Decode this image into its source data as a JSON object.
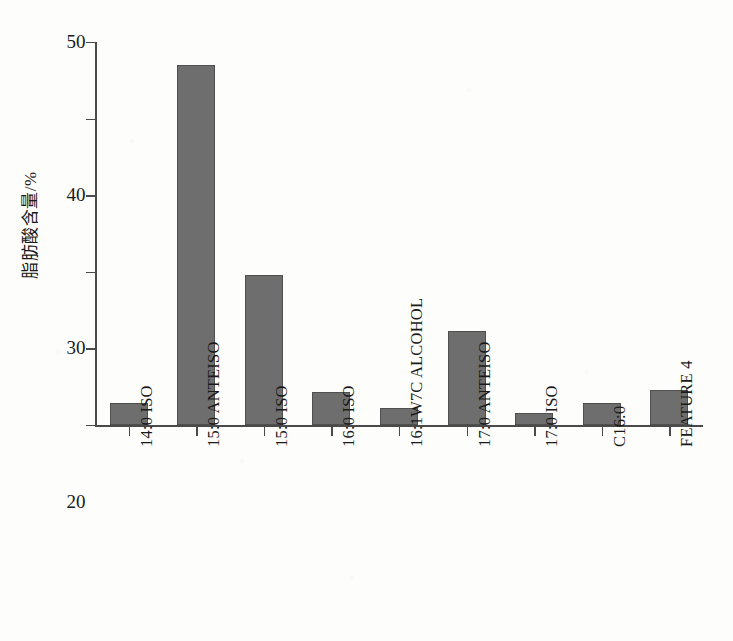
{
  "chart_data": {
    "type": "bar",
    "title": "",
    "subtitle": "",
    "xlabel": "",
    "ylabel": "脂肪酸含量/%",
    "ylim": [
      0,
      50
    ],
    "yticks": [
      0,
      10,
      20,
      30,
      40,
      50
    ],
    "ytick_labels": [
      "0",
      "10",
      "20",
      "30",
      "40",
      "50"
    ],
    "grid": false,
    "legend": null,
    "legend_position": "none",
    "categories": [
      "14:0 ISO",
      "15:0 ANTEISO",
      "15:0 ISO",
      "16:0 ISO",
      "16:1W7C ALCOHOL",
      "17:0 ANTEISO",
      "17:0 ISO",
      "C16:0",
      "FEATURE 4"
    ],
    "values": [
      2.9,
      47.0,
      19.6,
      4.3,
      2.2,
      12.3,
      1.6,
      2.9,
      4.6
    ],
    "bar_color": "#6e6e6e",
    "bar_edge_color": "#4f4f4f",
    "axis_color": "#4a4a4a",
    "background_color": "#fdfdfb",
    "annotations": []
  }
}
